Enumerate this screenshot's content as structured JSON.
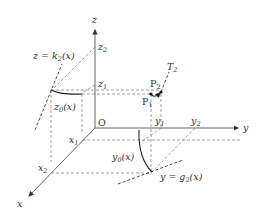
{
  "diagram": {
    "type": "3d-coordinate-construction",
    "axes": {
      "x_label": "x",
      "y_label": "y",
      "z_label": "z",
      "origin_label": "O"
    },
    "ticks": {
      "x1": "x",
      "x1_sub": "1",
      "x2": "x",
      "x2_sub": "2",
      "y1": "y",
      "y1_sub": "1",
      "y2": "y",
      "y2_sub": "2",
      "z1": "z",
      "z1_sub": "1",
      "z2": "z",
      "z2_sub": "2"
    },
    "points": {
      "p1": "P",
      "p1_sub": "1",
      "p2": "P",
      "p2_sub": "2"
    },
    "labels": {
      "tangent": "T",
      "tangent_sub": "2",
      "z_curve": "z = k",
      "z_curve_sub": "2",
      "z_curve_arg": "(x)",
      "z0": "z",
      "z0_sub": "0",
      "z0_arg": "(x)",
      "y0": "y",
      "y0_sub": "0",
      "y0_arg": "(x)",
      "y_curve": "y = g",
      "y_curve_sub": "2",
      "y_curve_arg": "(x)"
    }
  }
}
